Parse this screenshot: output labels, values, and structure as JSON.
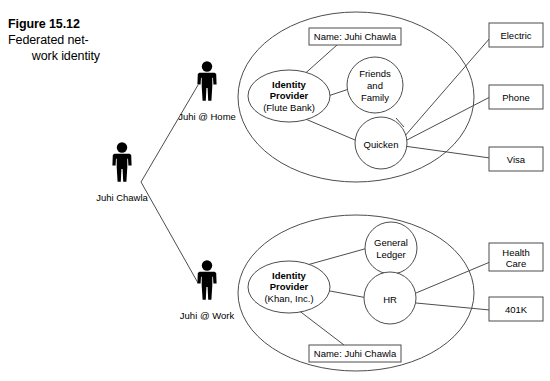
{
  "figure": {
    "number": "Figure 15.12",
    "caption_line1": "Federated net-",
    "caption_line2": "work identity"
  },
  "people": [
    {
      "id": "juhi-chawla",
      "label": "Juhi Chawla",
      "icon": "person-icon"
    },
    {
      "id": "juhi-at-home",
      "label": "Juhi @ Home",
      "icon": "person-icon"
    },
    {
      "id": "juhi-at-work",
      "label": "Juhi @ Work",
      "icon": "person-icon"
    }
  ],
  "domains": [
    {
      "id": "home-domain",
      "name_box": "Name: Juhi Chawla",
      "identity_provider": {
        "line1": "Identity",
        "line2": "Provider",
        "line3": "(Flute Bank)"
      },
      "services": [
        {
          "id": "friends-and-family",
          "label": "Friends and Family",
          "line1": "Friends",
          "line2": "and",
          "line3": "Family"
        },
        {
          "id": "quicken",
          "label": "Quicken",
          "line1": "Quicken",
          "line2": "",
          "line3": ""
        }
      ],
      "external": [
        {
          "id": "electric",
          "line1": "Electric",
          "line2": ""
        },
        {
          "id": "phone",
          "line1": "Phone",
          "line2": ""
        },
        {
          "id": "visa",
          "line1": "Visa",
          "line2": ""
        }
      ]
    },
    {
      "id": "work-domain",
      "name_box": "Name: Juhi Chawla",
      "identity_provider": {
        "line1": "Identity",
        "line2": "Provider",
        "line3": "(Khan, Inc.)"
      },
      "services": [
        {
          "id": "general-ledger",
          "label": "General Ledger",
          "line1": "General",
          "line2": "Ledger",
          "line3": ""
        },
        {
          "id": "hr",
          "label": "HR",
          "line1": "HR",
          "line2": "",
          "line3": ""
        }
      ],
      "external": [
        {
          "id": "health-care",
          "line1": "Health",
          "line2": "Care"
        },
        {
          "id": "401k",
          "line1": "401K",
          "line2": ""
        }
      ]
    }
  ],
  "colors": {
    "stroke": "#4d4d4d",
    "text": "#000000",
    "background": "#ffffff",
    "icon": "#000000"
  }
}
